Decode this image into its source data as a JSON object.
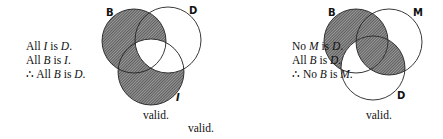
{
  "left": {
    "premises": [
      {
        "parts": [
          "All ",
          "I",
          " is ",
          "D",
          "."
        ]
      },
      {
        "parts": [
          "All ",
          "B",
          " is ",
          "I",
          "."
        ]
      },
      {
        "parts": [
          "∴ All ",
          "B",
          " is ",
          "D",
          "."
        ]
      }
    ],
    "premise_text": [
      "All I is D.",
      "All B is I.",
      "∴ All B is D."
    ],
    "circles": {
      "top_left": "B",
      "top_right": "D",
      "bottom": "I"
    },
    "verdict": "valid."
  },
  "right": {
    "premises": [
      {
        "parts": [
          "No ",
          "M",
          " is ",
          "D",
          "."
        ]
      },
      {
        "parts": [
          "All ",
          "B",
          " is ",
          "D",
          "."
        ]
      },
      {
        "parts": [
          "∴ No ",
          "B",
          " is ",
          "M",
          "."
        ]
      }
    ],
    "premise_text": [
      "No M is D.",
      "All B is D.",
      "∴ No B is M."
    ],
    "circles": {
      "top_left": "B",
      "top_right": "M",
      "bottom": "D"
    },
    "verdict": "valid."
  },
  "bottom_verdict": "valid.",
  "colors": {
    "shade": "#555555",
    "line": "#222222",
    "background": "#ffffff"
  }
}
